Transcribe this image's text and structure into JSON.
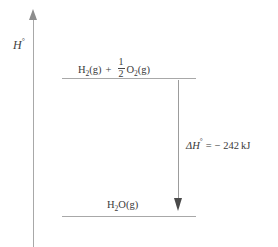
{
  "figure": {
    "type": "enthalpy-level-diagram",
    "background_color": "#ffffff",
    "line_color": "#a8a8a8",
    "text_color": "#3a3a3a"
  },
  "axis": {
    "name": "enthalpy-axis",
    "label_symbol": "H",
    "label_superscript": "°",
    "arrow_direction": "up"
  },
  "levels": [
    {
      "id": "reactants",
      "label_parts": {
        "species1": "H",
        "species1_sub": "2",
        "species1_state": "(g)",
        "operator": "+",
        "fraction_numerator": "1",
        "fraction_denominator": "2",
        "species2": "O",
        "species2_sub": "2",
        "species2_state": "(g)"
      },
      "relative_position": "top"
    },
    {
      "id": "products",
      "label_parts": {
        "species1": "H",
        "species1_sub": "2",
        "species1_rest": "O",
        "species1_state": "(g)"
      },
      "relative_position": "bottom"
    }
  ],
  "reaction_arrow": {
    "name": "enthalpy-change-arrow",
    "direction": "down",
    "label": {
      "delta": "Δ",
      "symbol": "H",
      "superscript": "°",
      "equals": "=",
      "sign": "−",
      "value": "242",
      "units": "kJ"
    }
  },
  "chart_data": {
    "type": "bar",
    "title": "",
    "xlabel": "",
    "ylabel": "H°",
    "categories": [
      "H2(g) + 1/2 O2(g)",
      "H2O(g)"
    ],
    "values": [
      0,
      -242
    ],
    "units": "kJ",
    "annotations": [
      {
        "text": "ΔH° = − 242 kJ",
        "from_level": "H2(g) + 1/2 O2(g)",
        "to_level": "H2O(g)",
        "value": -242
      }
    ],
    "grid": false,
    "legend": "none"
  }
}
